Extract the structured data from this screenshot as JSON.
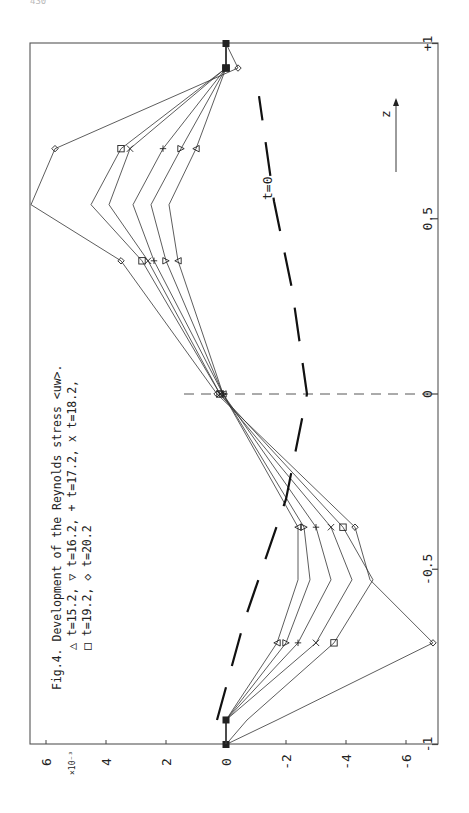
{
  "page": {
    "number": "430"
  },
  "caption": {
    "line1": "Fig.4. Development of the Reynolds stress <uw>.",
    "line2": "△ t=15.2, ▽ t=16.2, + t=17.2, x t=18.2,",
    "line3": "□ t=19.2, ◇ t=20.2"
  },
  "axes": {
    "value_label_scale": "×10⁻³",
    "value_ticks": [
      "6",
      "4",
      "2",
      "0",
      "-2",
      "-4",
      "-6"
    ],
    "z_ticks": [
      "-1",
      "-0.5",
      "0",
      "0.5",
      "+1"
    ],
    "z_label": "z",
    "t0_label": "t=0"
  },
  "chart_data": {
    "type": "line",
    "title": "Fig.4. Development of the Reynolds stress <uw>.",
    "orientation": "rotated 90° counter-clockwise (z runs vertically on right edge, <uw> horizontally along bottom)",
    "xlabel": "z",
    "ylabel": "<uw> (×10⁻³)",
    "xlim": [
      -1,
      1
    ],
    "ylim": [
      -7,
      6.5
    ],
    "x_ticks": [
      -1,
      -0.5,
      0,
      0.5,
      1
    ],
    "y_ticks": [
      -6,
      -4,
      -2,
      0,
      2,
      4,
      6
    ],
    "grid": false,
    "annotations": [
      "t=0 (thick dashed reference profile)",
      "z arrow",
      "vertical dashed line at z=0"
    ],
    "x": [
      -1.0,
      -0.93,
      -0.71,
      -0.53,
      -0.38,
      0.0,
      0.38,
      0.54,
      0.7,
      0.93,
      1.0
    ],
    "series": [
      {
        "name": "t=15.2",
        "marker": "triangle-up",
        "values": [
          0,
          0.0,
          -1.7,
          -2.4,
          -2.4,
          0.1,
          1.6,
          1.9,
          1.0,
          0.0,
          0
        ]
      },
      {
        "name": "t=16.2",
        "marker": "triangle-down",
        "values": [
          0,
          0.0,
          -2.0,
          -2.8,
          -2.6,
          0.1,
          2.0,
          2.5,
          1.5,
          0.0,
          0
        ]
      },
      {
        "name": "t=17.2",
        "marker": "plus",
        "values": [
          0,
          0.0,
          -2.4,
          -3.5,
          -3.0,
          0.1,
          2.4,
          3.1,
          2.1,
          0.0,
          0
        ]
      },
      {
        "name": "t=18.2",
        "marker": "x",
        "values": [
          0,
          0.0,
          -3.0,
          -4.2,
          -3.5,
          0.2,
          2.6,
          3.9,
          3.2,
          0.0,
          0
        ]
      },
      {
        "name": "t=19.2",
        "marker": "square",
        "values": [
          0,
          -0.7,
          -3.6,
          -4.9,
          -3.9,
          0.2,
          2.8,
          4.5,
          3.5,
          0.0,
          0
        ]
      },
      {
        "name": "t=20.2",
        "marker": "diamond",
        "values": [
          0,
          -1.7,
          -6.9,
          -4.8,
          -4.3,
          0.3,
          3.5,
          6.5,
          5.7,
          -0.4,
          0
        ]
      },
      {
        "name": "t=0",
        "marker": "none",
        "style": "thick dashed",
        "x": [
          -0.93,
          -0.65,
          -0.3,
          0.0,
          0.3,
          0.55,
          0.85
        ],
        "values": [
          0.3,
          -0.6,
          -2.0,
          -2.7,
          -2.2,
          -1.6,
          -1.1
        ]
      }
    ],
    "legend": [
      "△ t=15.2",
      "▽ t=16.2",
      "+ t=17.2",
      "x t=18.2",
      "□ t=19.2",
      "◇ t=20.2"
    ]
  }
}
